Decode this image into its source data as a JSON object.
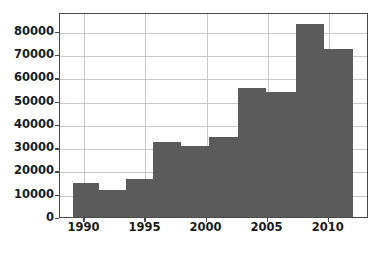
{
  "chart_data": {
    "type": "bar",
    "title": "",
    "xlabel": "",
    "ylabel": "",
    "xlim": [
      1988.0,
      2013.3
    ],
    "ylim": [
      0,
      88000
    ],
    "grid": true,
    "legend": null,
    "bar_color": "#5b5b5b",
    "axis_color": "#4a4a4a",
    "grid_color": "#c9c9c9",
    "background": "#ffffff",
    "yticks": [
      0,
      10000,
      20000,
      30000,
      40000,
      50000,
      60000,
      70000,
      80000
    ],
    "ytick_labels": [
      "0",
      "10000",
      "20000",
      "30000",
      "40000",
      "50000",
      "60000",
      "70000",
      "80000"
    ],
    "xticks": [
      1990,
      1995,
      2000,
      2005,
      2010
    ],
    "xtick_labels": [
      "1990",
      "1995",
      "2000",
      "2005",
      "2010"
    ],
    "bins": [
      {
        "x0": 1989.1,
        "x1": 1991.2,
        "value": 14500
      },
      {
        "x0": 1991.2,
        "x1": 1993.4,
        "value": 11500
      },
      {
        "x0": 1993.4,
        "x1": 1995.6,
        "value": 16500
      },
      {
        "x0": 1995.6,
        "x1": 1997.9,
        "value": 32000
      },
      {
        "x0": 1997.9,
        "x1": 2000.2,
        "value": 30500
      },
      {
        "x0": 2000.2,
        "x1": 2002.6,
        "value": 34500
      },
      {
        "x0": 2002.6,
        "x1": 2004.9,
        "value": 55500
      },
      {
        "x0": 2004.9,
        "x1": 2007.3,
        "value": 53500
      },
      {
        "x0": 2007.3,
        "x1": 2009.6,
        "value": 83000
      },
      {
        "x0": 2009.6,
        "x1": 2012.0,
        "value": 72000
      }
    ]
  }
}
